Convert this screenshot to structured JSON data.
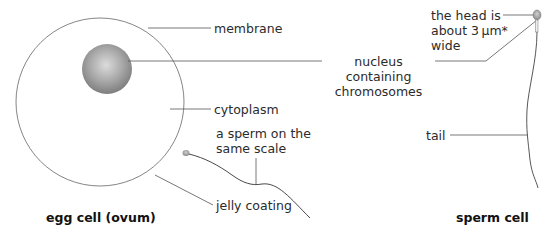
{
  "egg": {
    "title": "egg cell (ovum)",
    "labels": {
      "membrane": "membrane",
      "nucleus_line1": "nucleus",
      "nucleus_line2": "containing",
      "nucleus_line3": "chromosomes",
      "cytoplasm": "cytoplasm",
      "sperm_scale_line1": "a sperm on the",
      "sperm_scale_line2": "same scale",
      "jelly": "jelly coating"
    }
  },
  "sperm": {
    "title": "sperm cell",
    "labels": {
      "head_line1": "the head is",
      "head_line2": "about 3 µm*",
      "head_line3": "wide",
      "tail": "tail"
    }
  },
  "colors": {
    "line": "#555555",
    "nucleus_center": "#d9d9d9",
    "nucleus_edge": "#7a7a7a"
  }
}
